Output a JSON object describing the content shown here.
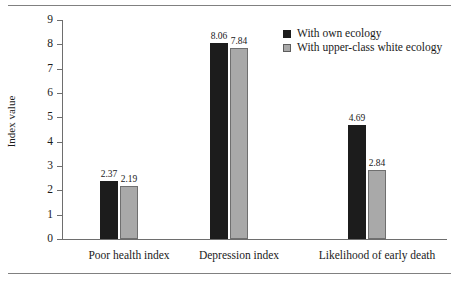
{
  "chart_data": {
    "type": "bar",
    "title": "",
    "xlabel": "",
    "ylabel": "Index value",
    "ylim": [
      0,
      9
    ],
    "ytick_labels": [
      "9",
      "8",
      "7",
      "6",
      "5",
      "4",
      "3",
      "2",
      "1",
      "0"
    ],
    "grid": false,
    "legend_position": "top-right",
    "categories": [
      "Poor health index",
      "Depression index",
      "Likelihood of early death"
    ],
    "series": [
      {
        "name": "With own ecology",
        "color": "#1c1c1c",
        "values": [
          2.37,
          8.06,
          4.69
        ],
        "value_labels": [
          "2.37",
          "8.06",
          "4.69"
        ]
      },
      {
        "name": "With upper-class white ecology",
        "color": "#a9a9a9",
        "values": [
          2.19,
          7.84,
          2.84
        ],
        "value_labels": [
          "2.19",
          "7.84",
          "2.84"
        ]
      }
    ]
  }
}
